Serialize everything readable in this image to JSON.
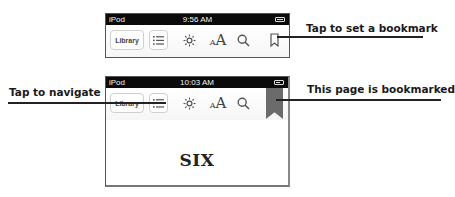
{
  "screens": [
    {
      "status_bar": {
        "carrier": "iPod",
        "time": "9:56 AM",
        "battery": "full"
      },
      "toolbar": {
        "library_label": "Library",
        "icons": [
          "list-icon",
          "brightness-icon",
          "font-size-icon",
          "search-icon",
          "bookmark-icon"
        ],
        "bookmarked": false
      }
    },
    {
      "status_bar": {
        "carrier": "iPod",
        "time": "10:03 AM",
        "battery": "charging"
      },
      "toolbar": {
        "library_label": "Library",
        "icons": [
          "list-icon",
          "brightness-icon",
          "font-size-icon",
          "search-icon",
          "bookmark-ribbon-icon"
        ],
        "bookmarked": true
      },
      "page": {
        "chapter_title": "SIX"
      }
    }
  ],
  "callouts": {
    "set_bookmark": "Tap to set a bookmark",
    "navigate": "Tap to navigate",
    "bookmarked": "This page is bookmarked"
  },
  "font_size_glyph": {
    "small": "A",
    "large": "A"
  },
  "colors": {
    "status_bar_bg": "#0b0b0b",
    "ribbon": "#6b6b6b",
    "callout_text": "#1a1a1a"
  }
}
